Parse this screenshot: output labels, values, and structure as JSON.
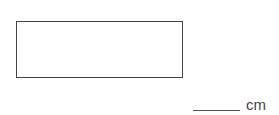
{
  "figure": {
    "shape": "rectangle",
    "border_color": "#444444"
  },
  "answer": {
    "value": "",
    "unit": "cm"
  }
}
